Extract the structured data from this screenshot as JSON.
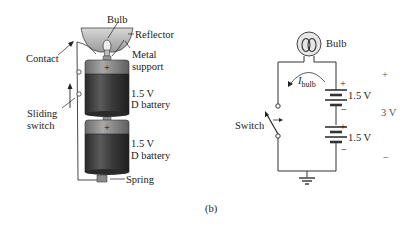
{
  "figure": {
    "caption": "(b)"
  },
  "left_illustration": {
    "labels": {
      "bulb": "Bulb",
      "reflector": "Reflector",
      "contact": "Contact",
      "metal_support_line1": "Metal",
      "metal_support_line2": "support",
      "battery1_line1": "1.5 V",
      "battery1_line2": "D battery",
      "battery2_line1": "1.5 V",
      "battery2_line2": "D battery",
      "sliding_switch_line1": "Sliding",
      "sliding_switch_line2": "switch",
      "spring": "Spring",
      "battery1_plus": "+",
      "battery2_plus": "+"
    }
  },
  "schematic": {
    "labels": {
      "bulb": "Bulb",
      "current": "I",
      "current_sub": "bulb",
      "switch": "Switch",
      "battery_top_voltage": "1.5 V",
      "battery_top_plus": "+",
      "battery_top_minus": "−",
      "battery_bottom_voltage": "1.5 V",
      "battery_bottom_plus": "+",
      "battery_bottom_minus": "−",
      "total_plus": "+",
      "total_voltage": "3 V",
      "total_minus": "−"
    }
  },
  "colors": {
    "line": "#333333",
    "battery_body": "#3a3a3a",
    "battery_band": "#8a8a8a"
  }
}
